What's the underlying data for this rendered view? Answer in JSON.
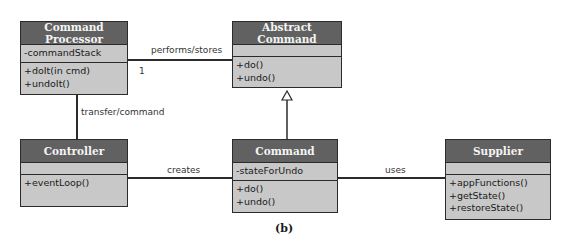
{
  "classes": {
    "command_processor": {
      "name": "Command Processor",
      "attributes": [
        "-commandStack"
      ],
      "methods": [
        "+doIt(in cmd)",
        "+undoIt()"
      ]
    },
    "abstract_command": {
      "name": "Abstract Command",
      "attributes": [],
      "methods": [
        "+do()",
        "+undo()"
      ]
    },
    "controller": {
      "name": "Controller",
      "attributes": [],
      "methods": [
        "+eventLoop()"
      ]
    },
    "command": {
      "name": "Command",
      "attributes": [
        "-stateForUndo"
      ],
      "methods": [
        "+do()",
        "+undo()"
      ]
    },
    "supplier": {
      "name": "Supplier",
      "attributes": [],
      "methods": [
        "+appFunctions()",
        "+getState()",
        "+restoreState()"
      ]
    }
  },
  "associations": {
    "performs": {
      "label": "performs/stores",
      "multiplicity": "1"
    },
    "transfer": {
      "label": "transfer/command"
    },
    "creates": {
      "label": "creates"
    },
    "uses": {
      "label": "uses"
    }
  },
  "caption": "(b)",
  "colors": {
    "header": "#616161",
    "body": "#c8c8c8",
    "border": "#2b2b2b"
  }
}
